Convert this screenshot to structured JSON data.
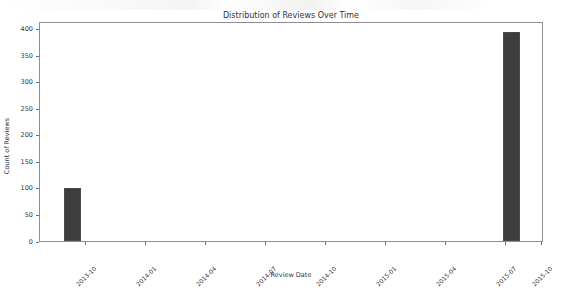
{
  "chart_data": {
    "type": "bar",
    "title": "Distribution of Reviews Over Time",
    "xlabel": "Review Date",
    "ylabel": "Count of Reviews",
    "categories": [
      "2013-10",
      "2015-10"
    ],
    "values": [
      100,
      395
    ],
    "bars": [
      {
        "label": "2013-10",
        "value": 100,
        "x_frac": 0.0476,
        "width_frac": 0.0337
      },
      {
        "label": "2015-10",
        "value": 395,
        "x_frac": 0.9187,
        "width_frac": 0.0337
      }
    ],
    "ylim": [
      0,
      415
    ],
    "yticks": [
      0,
      50,
      100,
      150,
      200,
      250,
      300,
      350,
      400
    ],
    "ytick_labels": [
      "0",
      "50",
      "100",
      "150",
      "200",
      "250",
      "300",
      "350",
      "400"
    ],
    "xticks": [
      0.0913,
      0.2103,
      0.3294,
      0.4484,
      0.5675,
      0.6865,
      0.8056,
      0.9246,
      0.996
    ],
    "xtick_labels": [
      "2013-10",
      "2014-01",
      "2014-04",
      "2014-07",
      "2014-10",
      "2015-01",
      "2015-04",
      "2015-07",
      "2015-10"
    ],
    "grid": false,
    "legend": null,
    "bar_color": "#3d3d3d",
    "background_color": "#ffffff",
    "axis_color": "#8d8d95",
    "xtick_rotation_deg": -45
  }
}
